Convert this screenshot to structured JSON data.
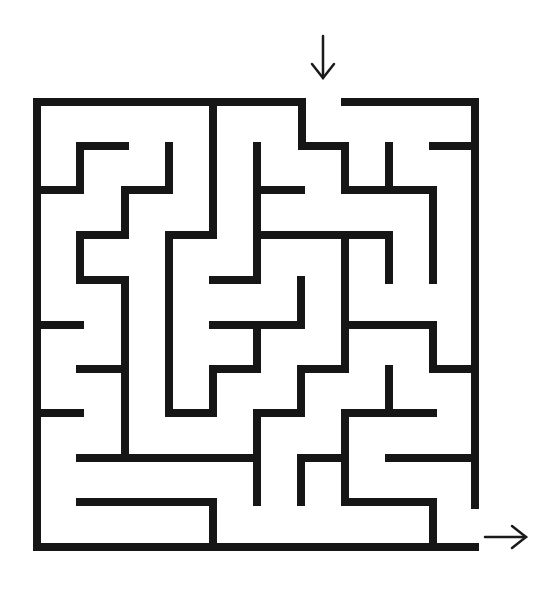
{
  "puzzle": {
    "type": "maze",
    "title_fragment": "",
    "grid": {
      "cols": 10,
      "rows": 10,
      "x_lines": [
        37,
        80,
        125,
        169,
        213,
        257,
        301,
        345,
        389,
        433,
        475
      ],
      "y_lines": [
        102,
        146,
        190,
        235,
        280,
        325,
        369,
        413,
        458,
        502,
        547
      ]
    },
    "colors": {
      "wall": "#161616",
      "background": "#ffffff"
    },
    "entrance": {
      "label": "start-arrow",
      "direction": "down",
      "x": 323,
      "y1": 58,
      "y2": 78
    },
    "exit": {
      "label": "end-arrow",
      "direction": "right",
      "y": 537,
      "x1": 485,
      "x2": 526
    },
    "walls": [
      [
        37,
        102,
        302,
        102
      ],
      [
        345,
        102,
        475,
        102
      ],
      [
        37,
        102,
        37,
        547
      ],
      [
        37,
        547,
        475,
        547
      ],
      [
        475,
        102,
        475,
        505
      ],
      [
        302,
        102,
        302,
        146
      ],
      [
        302,
        146,
        345,
        146
      ],
      [
        345,
        146,
        345,
        190
      ],
      [
        345,
        190,
        433,
        190
      ],
      [
        389,
        146,
        389,
        190
      ],
      [
        433,
        146,
        475,
        146
      ],
      [
        433,
        190,
        433,
        280
      ],
      [
        80,
        146,
        125,
        146
      ],
      [
        80,
        146,
        80,
        190
      ],
      [
        37,
        190,
        80,
        190
      ],
      [
        169,
        146,
        169,
        190
      ],
      [
        125,
        190,
        169,
        190
      ],
      [
        125,
        190,
        125,
        235
      ],
      [
        80,
        235,
        125,
        235
      ],
      [
        80,
        235,
        80,
        280
      ],
      [
        80,
        280,
        125,
        280
      ],
      [
        125,
        280,
        125,
        458
      ],
      [
        213,
        102,
        213,
        235
      ],
      [
        169,
        235,
        213,
        235
      ],
      [
        169,
        235,
        169,
        413
      ],
      [
        169,
        413,
        213,
        413
      ],
      [
        213,
        369,
        213,
        413
      ],
      [
        213,
        369,
        257,
        369
      ],
      [
        257,
        325,
        257,
        369
      ],
      [
        213,
        325,
        301,
        325
      ],
      [
        301,
        280,
        301,
        325
      ],
      [
        257,
        146,
        257,
        280
      ],
      [
        257,
        190,
        301,
        190
      ],
      [
        257,
        235,
        389,
        235
      ],
      [
        389,
        235,
        389,
        280
      ],
      [
        213,
        280,
        257,
        280
      ],
      [
        345,
        235,
        345,
        369
      ],
      [
        301,
        369,
        345,
        369
      ],
      [
        301,
        369,
        301,
        413
      ],
      [
        257,
        413,
        301,
        413
      ],
      [
        257,
        413,
        257,
        502
      ],
      [
        345,
        325,
        433,
        325
      ],
      [
        433,
        325,
        433,
        369
      ],
      [
        433,
        369,
        475,
        369
      ],
      [
        389,
        369,
        389,
        413
      ],
      [
        345,
        413,
        433,
        413
      ],
      [
        345,
        413,
        345,
        502
      ],
      [
        301,
        458,
        345,
        458
      ],
      [
        301,
        458,
        301,
        502
      ],
      [
        345,
        502,
        433,
        502
      ],
      [
        433,
        502,
        433,
        547
      ],
      [
        389,
        458,
        475,
        458
      ],
      [
        37,
        325,
        80,
        325
      ],
      [
        80,
        369,
        125,
        369
      ],
      [
        37,
        413,
        80,
        413
      ],
      [
        80,
        458,
        257,
        458
      ],
      [
        80,
        502,
        213,
        502
      ],
      [
        213,
        502,
        213,
        547
      ]
    ]
  }
}
